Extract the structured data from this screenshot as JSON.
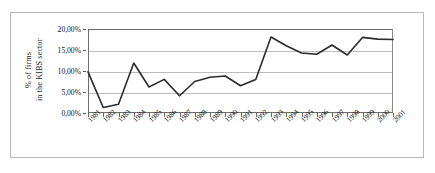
{
  "chart_data": {
    "type": "line",
    "title": "",
    "subtitle": "",
    "xlabel": "",
    "ylabel": "% of firms in the KIBS sector",
    "ylabel_line1": "% of firms",
    "ylabel_line2": "in the KIBS sector",
    "ylim": [
      0,
      20
    ],
    "yunit": "%",
    "grid": true,
    "legend": "none",
    "line_color": "#2b2b2b",
    "grid_color": "#bdbdbd",
    "axis_color": "#6e6e6e",
    "background_color": "#ffffff",
    "ytick_labels": [
      "20,00%",
      "15,00%",
      "10,00%",
      "5,00%",
      "0,00%"
    ],
    "ytick_values": [
      20,
      15,
      10,
      5,
      0
    ],
    "categories": [
      "1981",
      "1982",
      "1983",
      "1984",
      "1985",
      "1986",
      "1987",
      "1988",
      "1989",
      "1990",
      "1991",
      "1992",
      "1993",
      "1994",
      "1995",
      "1996",
      "1997",
      "1998",
      "1999",
      "2000",
      "2001"
    ],
    "values": [
      9.8,
      1.3,
      2.1,
      11.9,
      6.2,
      8.0,
      4.1,
      7.5,
      8.5,
      8.8,
      6.5,
      8.0,
      18.1,
      16.0,
      14.3,
      14.0,
      16.2,
      13.8,
      18.0,
      17.6,
      17.5
    ],
    "series": [
      {
        "name": "% of firms in the KIBS sector",
        "values": [
          9.8,
          1.3,
          2.1,
          11.9,
          6.2,
          8.0,
          4.1,
          7.5,
          8.5,
          8.8,
          6.5,
          8.0,
          18.1,
          16.0,
          14.3,
          14.0,
          16.2,
          13.8,
          18.0,
          17.6,
          17.5
        ]
      }
    ]
  }
}
